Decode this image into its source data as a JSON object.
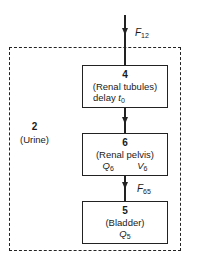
{
  "diagram": {
    "outer_compartment": {
      "number": "2",
      "name": "(Urine)"
    },
    "inflow": {
      "symbol": "F",
      "subscript": "12"
    },
    "boxes": [
      {
        "number": "4",
        "name": "(Renal tubules)",
        "detail_text": "delay ",
        "detail_symbol": "t",
        "detail_subscript": "0"
      },
      {
        "number": "6",
        "name": "(Renal pelvis)",
        "q_symbol": "Q",
        "q_subscript": "6",
        "v_symbol": "V",
        "v_subscript": "6"
      },
      {
        "number": "5",
        "name": "(Bladder)",
        "q_symbol": "Q",
        "q_subscript": "5"
      }
    ],
    "flow_6_to_5": {
      "symbol": "F",
      "subscript": "65"
    }
  }
}
